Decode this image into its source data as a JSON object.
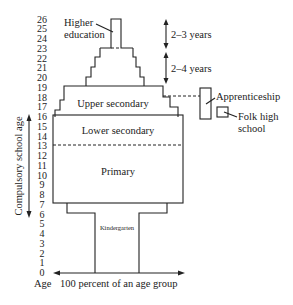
{
  "diagram": {
    "y_axis_ticks": [
      "0",
      "1",
      "2",
      "3",
      "4",
      "5",
      "6",
      "7",
      "8",
      "9",
      "10",
      "11",
      "12",
      "13",
      "14",
      "15",
      "16",
      "17",
      "18",
      "19",
      "20",
      "21",
      "22",
      "23",
      "24",
      "25",
      "26"
    ],
    "x_axis_label_left": "Age",
    "x_axis_label": "100 percent of an age group",
    "compulsory_label": "Compulsory school age",
    "levels": {
      "higher_education": "Higher",
      "higher_education_2": "education",
      "upper_secondary": "Upper secondary",
      "lower_secondary": "Lower secondary",
      "primary": "Primary",
      "kindergarten": "Kindergarten"
    },
    "side": {
      "years_top": "2–3 years",
      "years_bottom": "2–4 years",
      "apprenticeship": "Apprenticeship",
      "folk_high_school_1": "Folk high",
      "folk_high_school_2": "school"
    }
  }
}
